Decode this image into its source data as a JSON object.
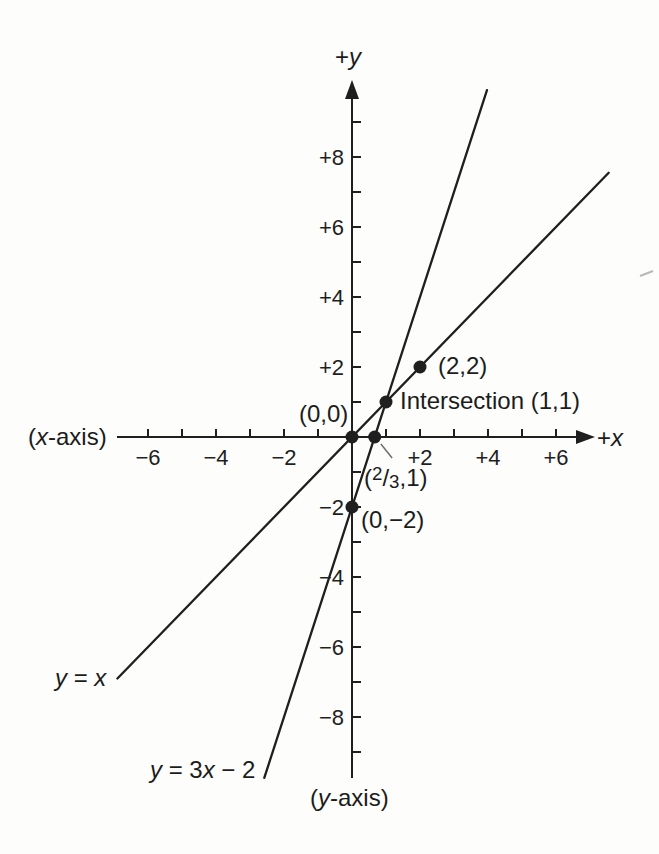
{
  "figure": {
    "background": "#fdfdfb",
    "ink_color": "#1f1f1f"
  },
  "labels": {
    "plus_y": {
      "sign": "+",
      "var": "y"
    },
    "plus_x": {
      "sign": "+",
      "var": "x"
    },
    "x_axis_name": {
      "open": "(",
      "var": "x",
      "rest": "-axis)"
    },
    "y_axis_name": {
      "open": "(",
      "var": "y",
      "rest": "-axis)"
    },
    "origin": "(0,0)",
    "point_2_2": "(2,2)",
    "intersection": "Intersection (1,1)",
    "point_two_thirds": {
      "open": "(",
      "num": "2",
      "slash": "/",
      "den": "3",
      "rest": ",1)"
    },
    "point_0_neg2": "(0,−2)",
    "line1_eq": {
      "y": "y",
      "mid": " = ",
      "x": "x"
    },
    "line2_eq": {
      "y": "y",
      "mid": " = 3",
      "x": "x",
      "rest": " − 2"
    }
  },
  "chart_data": {
    "type": "line",
    "xlabel": "+x",
    "ylabel": "+y",
    "axes": {
      "x": {
        "min": -6.9,
        "max": 7.0,
        "tick_step": 1,
        "tick_values": [
          -6,
          -5,
          -4,
          -3,
          -2,
          -1,
          1,
          2,
          3,
          4,
          5,
          6
        ],
        "labeled_ticks": [
          {
            "value": -6,
            "label": "−6"
          },
          {
            "value": -4,
            "label": "−4"
          },
          {
            "value": -2,
            "label": "−2"
          },
          {
            "value": 2,
            "label": "+2"
          },
          {
            "value": 4,
            "label": "+4"
          },
          {
            "value": 6,
            "label": "+6"
          }
        ],
        "arrow": "right"
      },
      "y": {
        "min": -9.7,
        "max": 9.8,
        "tick_step": 1,
        "tick_values": [
          -9,
          -8,
          -7,
          -6,
          -5,
          -4,
          -3,
          -2,
          -1,
          1,
          2,
          3,
          4,
          5,
          6,
          7,
          8,
          9
        ],
        "labeled_ticks": [
          {
            "value": 8,
            "label": "+8"
          },
          {
            "value": 6,
            "label": "+6"
          },
          {
            "value": 4,
            "label": "+4"
          },
          {
            "value": 2,
            "label": "+2"
          },
          {
            "value": -2,
            "label": "−2"
          },
          {
            "value": -4,
            "label": "−4"
          },
          {
            "value": -6,
            "label": "−6"
          },
          {
            "value": -8,
            "label": "−8"
          }
        ],
        "arrow": "top"
      },
      "grid": false
    },
    "series": [
      {
        "name": "y = x",
        "slope": 1,
        "intercept": 0,
        "x_draw_range": [
          -6.9,
          7.55
        ]
      },
      {
        "name": "y = 3x − 2",
        "slope": 3,
        "intercept": -2,
        "x_draw_range": [
          -2.58,
          3.97
        ]
      }
    ],
    "points": [
      {
        "x": 0,
        "y": 0,
        "label": "(0,0)"
      },
      {
        "x": 0.667,
        "y": 0,
        "label": "(2/3,1)"
      },
      {
        "x": 1,
        "y": 1,
        "label": "Intersection (1,1)"
      },
      {
        "x": 2,
        "y": 2,
        "label": "(2,2)"
      },
      {
        "x": 0,
        "y": -2,
        "label": "(0,−2)"
      }
    ],
    "leader_line": {
      "from_xy": [
        1.18,
        -0.6
      ],
      "to_xy": [
        0.85,
        -0.2
      ]
    }
  }
}
